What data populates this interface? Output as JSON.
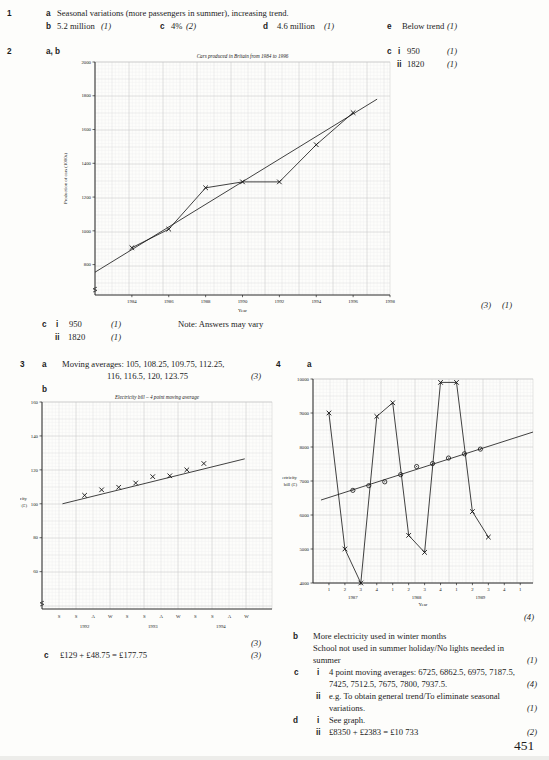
{
  "page": {
    "number": "451"
  },
  "q1": {
    "num": "1",
    "a": {
      "letter": "a",
      "text": "Seasonal variations (more passengers in summer), increasing trend."
    },
    "b": {
      "letter": "b",
      "value": "5.2 million",
      "mark": "(1)"
    },
    "c": {
      "letter": "c",
      "value": "4%",
      "mark": "(2)"
    },
    "d": {
      "letter": "d",
      "value": "4.6 million",
      "mark": "(1)"
    },
    "e": {
      "letter": "e",
      "value": "Below trend",
      "mark": "(1)"
    }
  },
  "q2": {
    "num": "2",
    "ab_letter": "a, b",
    "graph_mark_1": "(3)",
    "graph_mark_2": "(1)",
    "note": "Note: Answers may vary",
    "c_right": {
      "letter": "c",
      "i_label": "i",
      "i_value": "950",
      "i_mark": "(1)",
      "ii_label": "ii",
      "ii_value": "1820",
      "ii_mark": "(1)"
    },
    "c_bottom": {
      "letter": "c",
      "i_label": "i",
      "i_value": "950",
      "i_mark": "(1)",
      "ii_label": "ii",
      "ii_value": "1820",
      "ii_mark": "(1)"
    }
  },
  "q3": {
    "num": "3",
    "a": {
      "letter": "a",
      "line1": "Moving averages: 105, 108.25, 109.75, 112.25,",
      "line2": "116, 116.5, 120, 123.75",
      "mark": "(3)"
    },
    "b": {
      "letter": "b",
      "graph_mark": "(3)"
    },
    "c": {
      "letter": "c",
      "value": "£129 + £48.75 = £177.75",
      "mark": "(3)"
    }
  },
  "q4": {
    "num": "4",
    "a": {
      "letter": "a",
      "graph_mark": "(4)"
    },
    "b": {
      "letter": "b",
      "line1": "More electricity used in winter months",
      "line2": "School not used in summer holiday/No lights needed in",
      "line3": "summer",
      "mark": "(1)"
    },
    "c": {
      "letter": "c",
      "i_label": "i",
      "i_line1": "4 point moving averages: 6725, 6862.5, 6975, 7187.5,",
      "i_line2": "7425, 7512.5, 7675, 7800, 7937.5.",
      "i_mark": "(4)",
      "ii_label": "ii",
      "ii_line1": "e.g. To obtain general trend/To eliminate seasonal",
      "ii_line2": "variations.",
      "ii_mark": "(1)"
    },
    "d": {
      "letter": "d",
      "i_label": "i",
      "i_text": "See graph.",
      "ii_label": "ii",
      "ii_text": "£8350 + £2383 = £10 733",
      "ii_mark": "(2)"
    }
  },
  "chart_data": [
    {
      "id": "cars",
      "type": "line",
      "title": "Cars produced in Britain from 1984 to 1996",
      "xlabel": "Year",
      "ylabel": "Production of cars (1000s)",
      "xlim": [
        1982,
        1998
      ],
      "ylim": [
        620,
        2000
      ],
      "yticks": [
        800,
        1000,
        1200,
        1400,
        1600,
        1800,
        2000
      ],
      "xticks": [
        {
          "pos": 1984,
          "label": "1984"
        },
        {
          "pos": 1986,
          "label": "1986"
        },
        {
          "pos": 1988,
          "label": "1988"
        },
        {
          "pos": 1990,
          "label": "1990"
        },
        {
          "pos": 1992,
          "label": "1992"
        },
        {
          "pos": 1994,
          "label": "1994"
        },
        {
          "pos": 1996,
          "label": "1996"
        },
        {
          "pos": 1998,
          "label": "1998"
        }
      ],
      "series": [
        {
          "name": "cars-produced",
          "marker": "x",
          "connect": true,
          "x": [
            1984,
            1986,
            1988,
            1990,
            1992,
            1994,
            1996
          ],
          "y": [
            900,
            1010,
            1255,
            1290,
            1290,
            1510,
            1700
          ]
        }
      ],
      "trend": {
        "x": [
          1982,
          1997.3
        ],
        "y": [
          755,
          1780
        ]
      },
      "axis_break": true,
      "grid": "graph-paper"
    },
    {
      "id": "electricity-ma",
      "type": "line",
      "title": "Electricity bill – 4 point moving average",
      "ylabel_lines": [
        "Electricity",
        "bill (£)"
      ],
      "xlim": [
        0,
        13.5
      ],
      "ylim": [
        38,
        160
      ],
      "yticks": [
        60,
        80,
        100,
        120,
        140,
        160
      ],
      "xticks": [
        {
          "pos": 1,
          "label": "S"
        },
        {
          "pos": 2,
          "label": "S"
        },
        {
          "pos": 3,
          "label": "A"
        },
        {
          "pos": 4,
          "label": "W"
        },
        {
          "pos": 5,
          "label": "S"
        },
        {
          "pos": 6,
          "label": "S"
        },
        {
          "pos": 7,
          "label": "A"
        },
        {
          "pos": 8,
          "label": "W"
        },
        {
          "pos": 9,
          "label": "S"
        },
        {
          "pos": 10,
          "label": "S"
        },
        {
          "pos": 11,
          "label": "A"
        },
        {
          "pos": 12,
          "label": "W"
        }
      ],
      "year_labels": [
        {
          "pos": 2.5,
          "label": "1992"
        },
        {
          "pos": 6.5,
          "label": "1993"
        },
        {
          "pos": 10.5,
          "label": "1994"
        }
      ],
      "series": [
        {
          "name": "4-point-moving-average",
          "marker": "x",
          "connect": false,
          "x": [
            2.5,
            3.5,
            4.5,
            5.5,
            6.5,
            7.5,
            8.5,
            9.5
          ],
          "y": [
            105,
            108.25,
            109.75,
            112.25,
            116,
            116.5,
            120,
            123.75
          ]
        }
      ],
      "trend": {
        "x": [
          1.2,
          11.9
        ],
        "y": [
          100,
          126.5
        ]
      },
      "axis_break": true,
      "grid": "graph-paper"
    },
    {
      "id": "electricity-bills",
      "type": "line",
      "xlabel": "Year",
      "ylabel_lines": [
        "Electricity",
        "bill (£)"
      ],
      "xlim": [
        0,
        13.8
      ],
      "ylim": [
        4000,
        10000
      ],
      "yticks": [
        4000,
        5000,
        6000,
        7000,
        8000,
        9000,
        10000
      ],
      "xticks": [
        {
          "pos": 1,
          "label": "1"
        },
        {
          "pos": 2,
          "label": "2"
        },
        {
          "pos": 3,
          "label": "3"
        },
        {
          "pos": 4,
          "label": "4"
        },
        {
          "pos": 5,
          "label": "1"
        },
        {
          "pos": 6,
          "label": "2"
        },
        {
          "pos": 7,
          "label": "3"
        },
        {
          "pos": 8,
          "label": "4"
        },
        {
          "pos": 9,
          "label": "1"
        },
        {
          "pos": 10,
          "label": "2"
        },
        {
          "pos": 11,
          "label": "3"
        },
        {
          "pos": 12,
          "label": "4"
        },
        {
          "pos": 13,
          "label": "1"
        }
      ],
      "year_labels": [
        {
          "pos": 2.5,
          "label": "1987"
        },
        {
          "pos": 6.5,
          "label": "1988"
        },
        {
          "pos": 10.5,
          "label": "1989"
        }
      ],
      "series": [
        {
          "name": "quarterly-bills",
          "marker": "x",
          "connect": true,
          "x": [
            1,
            2,
            3,
            4,
            5,
            6,
            7,
            8,
            9,
            10,
            11
          ],
          "y": [
            9000,
            5000,
            4000,
            8900,
            9300,
            5400,
            4900,
            9900,
            9900,
            6100,
            5350
          ]
        },
        {
          "name": "4-point-moving-average",
          "marker": "circle",
          "connect": false,
          "x": [
            2.5,
            3.5,
            4.5,
            5.5,
            6.5,
            7.5,
            8.5,
            9.5,
            10.5
          ],
          "y": [
            6725,
            6862.5,
            6975,
            7187.5,
            7425,
            7512.5,
            7675,
            7800,
            7937.5
          ]
        }
      ],
      "trend": {
        "x": [
          0.5,
          13.8
        ],
        "y": [
          6440,
          8440
        ]
      },
      "axis_break": false,
      "grid": "graph-paper"
    }
  ]
}
